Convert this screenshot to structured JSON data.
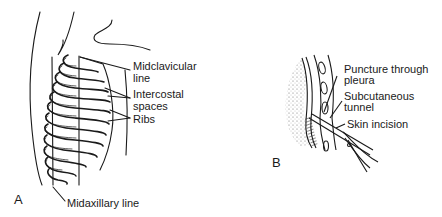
{
  "figure": {
    "panel_a": {
      "letter": "A",
      "labels": {
        "midclavicular_1": "Midclavicular",
        "midclavicular_2": "line",
        "intercostal_1": "Intercostal",
        "intercostal_2": "spaces",
        "ribs": "Ribs",
        "midaxillary": "Midaxillary line"
      },
      "rib_numbers": [
        "1",
        "2",
        "3",
        "4",
        "5",
        "6",
        "7",
        "8",
        "9"
      ]
    },
    "panel_b": {
      "letter": "B",
      "labels": {
        "puncture_1": "Puncture through",
        "puncture_2": "pleura",
        "subcutaneous_1": "Subcutaneous",
        "subcutaneous_2": "tunnel",
        "skin_incision": "Skin incision"
      }
    }
  }
}
